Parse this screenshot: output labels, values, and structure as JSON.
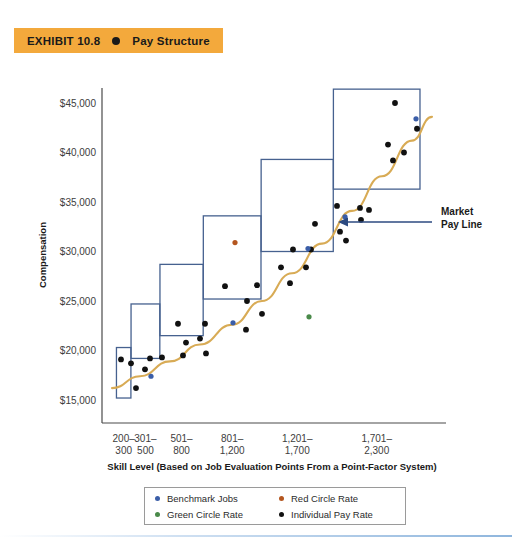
{
  "exhibit": {
    "label": "EXHIBIT 10.8",
    "bullet_icon": "filled-circle-icon",
    "title": "Pay Structure",
    "banner_color": "#f3a93c"
  },
  "annotation": {
    "market_pay_line_1": "Market",
    "market_pay_line_2": "Pay Line"
  },
  "legend": {
    "items": [
      {
        "label": "Benchmark Jobs",
        "color": "#3b5ea8"
      },
      {
        "label": "Red Circle Rate",
        "color": "#b4561f"
      },
      {
        "label": "Green Circle Rate",
        "color": "#4a8a4a"
      },
      {
        "label": "Individual Pay Rate",
        "color": "#111111"
      }
    ]
  },
  "chart_data": {
    "type": "scatter",
    "title": "Pay Structure",
    "xlabel": "Skill Level (Based on Job Evaluation Points From a Point-Factor System)",
    "ylabel": "Compensation",
    "ylim": [
      13500,
      47500
    ],
    "yticks": [
      15000,
      20000,
      25000,
      30000,
      35000,
      40000,
      45000
    ],
    "ytick_labels": [
      "$15,000",
      "$20,000",
      "$25,000",
      "$30,000",
      "$35,000",
      "$40,000",
      "$45,000"
    ],
    "grid": false,
    "legend_position": "bottom",
    "categories": [
      "200-\n300",
      "301-\n500",
      "501-\n800",
      "801-\n1,200",
      "1,201-\n1,700",
      "1,701-\n2,300"
    ],
    "xtick_labels": [
      {
        "line1": "200–",
        "line2": "300"
      },
      {
        "line1": "301–",
        "line2": "500"
      },
      {
        "line1": "501–",
        "line2": "800"
      },
      {
        "line1": "801–",
        "line2": "1,200"
      },
      {
        "line1": "1,201–",
        "line2": "1,700"
      },
      {
        "line1": "1,701–",
        "line2": "2,300"
      }
    ],
    "pay_grade_boxes": [
      {
        "grade": 1,
        "x_range": [
          200,
          300
        ],
        "pay_min": 15200,
        "pay_max": 20300
      },
      {
        "grade": 2,
        "x_range": [
          301,
          500
        ],
        "pay_min": 19200,
        "pay_max": 24700
      },
      {
        "grade": 3,
        "x_range": [
          501,
          800
        ],
        "pay_min": 21500,
        "pay_max": 28700
      },
      {
        "grade": 4,
        "x_range": [
          801,
          1200
        ],
        "pay_min": 25200,
        "pay_max": 33600
      },
      {
        "grade": 5,
        "x_range": [
          1201,
          1700
        ],
        "pay_min": 30000,
        "pay_max": 39300
      },
      {
        "grade": 6,
        "x_range": [
          1701,
          2300
        ],
        "pay_min": 36300,
        "pay_max": 46400
      }
    ],
    "market_pay_line": {
      "name": "Market Pay Line",
      "color": "#d8ab55",
      "points": [
        [
          112,
          16200
        ],
        [
          140,
          17400
        ],
        [
          170,
          18900
        ],
        [
          200,
          20600
        ],
        [
          232,
          22600
        ],
        [
          262,
          25000
        ],
        [
          292,
          27800
        ],
        [
          322,
          30800
        ],
        [
          352,
          34100
        ],
        [
          382,
          37600
        ],
        [
          412,
          41200
        ],
        [
          432,
          43600
        ]
      ]
    },
    "series": [
      {
        "name": "Individual Pay Rate",
        "color": "#111111",
        "points": [
          [
            121,
            19100
          ],
          [
            131,
            18700
          ],
          [
            150,
            19200
          ],
          [
            145,
            18100
          ],
          [
            136,
            16200
          ],
          [
            162,
            19300
          ],
          [
            178,
            22700
          ],
          [
            205,
            22700
          ],
          [
            186,
            20800
          ],
          [
            200,
            21200
          ],
          [
            206,
            19700
          ],
          [
            183,
            19500
          ],
          [
            225,
            26500
          ],
          [
            257,
            26600
          ],
          [
            247,
            25000
          ],
          [
            262,
            23700
          ],
          [
            246,
            22100
          ],
          [
            315,
            32800
          ],
          [
            311,
            30200
          ],
          [
            293,
            30200
          ],
          [
            281,
            28400
          ],
          [
            306,
            28400
          ],
          [
            290,
            26800
          ],
          [
            337,
            34600
          ],
          [
            360,
            34400
          ],
          [
            369,
            34200
          ],
          [
            361,
            33200
          ],
          [
            340,
            32000
          ],
          [
            346,
            31100
          ],
          [
            395,
            45000
          ],
          [
            417,
            42400
          ],
          [
            388,
            40800
          ],
          [
            404,
            40000
          ],
          [
            393,
            39200
          ]
        ]
      },
      {
        "name": "Benchmark Jobs",
        "color": "#3b5ea8",
        "points": [
          [
            151,
            17400
          ],
          [
            233,
            22800
          ],
          [
            308,
            30300
          ],
          [
            345,
            33500
          ],
          [
            416,
            43400
          ]
        ]
      },
      {
        "name": "Red Circle Rate",
        "color": "#b4561f",
        "points": [
          [
            235,
            30900
          ]
        ]
      },
      {
        "name": "Green Circle Rate",
        "color": "#4a8a4a",
        "points": [
          [
            309,
            23400
          ]
        ]
      }
    ]
  }
}
